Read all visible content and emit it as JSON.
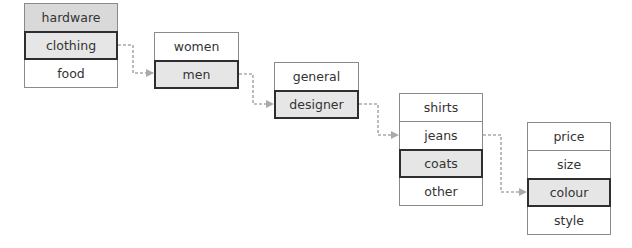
{
  "diagram": {
    "colors": {
      "border": "#8a8a8a",
      "selected_border": "#2e2e2e",
      "selected_fill": "#e6e6e6",
      "hover_fill": "#d9d9d9",
      "connector": "#aaaaaa",
      "text": "#333333"
    },
    "menus": [
      {
        "id": "level-1",
        "items": [
          {
            "label": "hardware",
            "state": "hovered"
          },
          {
            "label": "clothing",
            "state": "selected"
          },
          {
            "label": "food",
            "state": "normal"
          }
        ]
      },
      {
        "id": "level-2",
        "items": [
          {
            "label": "women",
            "state": "normal"
          },
          {
            "label": "men",
            "state": "selected"
          }
        ]
      },
      {
        "id": "level-3",
        "items": [
          {
            "label": "general",
            "state": "normal"
          },
          {
            "label": "designer",
            "state": "selected"
          }
        ]
      },
      {
        "id": "level-4",
        "items": [
          {
            "label": "shirts",
            "state": "normal"
          },
          {
            "label": "jeans",
            "state": "normal"
          },
          {
            "label": "coats",
            "state": "selected"
          },
          {
            "label": "other",
            "state": "normal"
          }
        ]
      },
      {
        "id": "level-5",
        "items": [
          {
            "label": "price",
            "state": "normal"
          },
          {
            "label": "size",
            "state": "normal"
          },
          {
            "label": "colour",
            "state": "selected"
          },
          {
            "label": "style",
            "state": "normal"
          }
        ]
      }
    ],
    "connectors": [
      {
        "from": "clothing",
        "to": "men"
      },
      {
        "from": "men",
        "to": "designer"
      },
      {
        "from": "designer",
        "to": "jeans"
      },
      {
        "from": "jeans",
        "to": "colour"
      }
    ]
  }
}
